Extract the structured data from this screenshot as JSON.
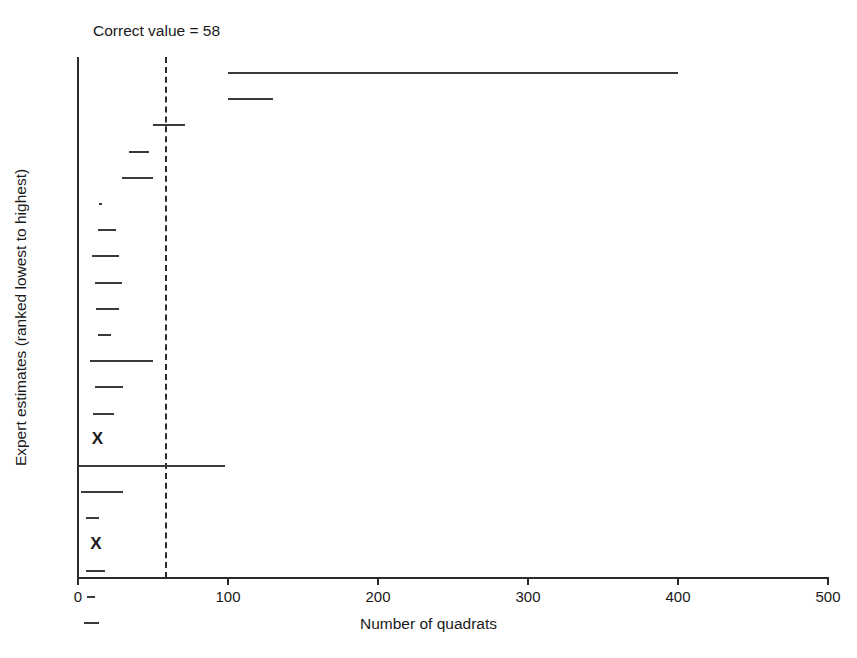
{
  "figure": {
    "x_axis_title": "Number of quadrats",
    "y_axis_title": "Expert estimates (ranked lowest to highest)",
    "reference_label": "Correct value = 58",
    "line_color": "#3a3a3a",
    "axis_color": "#2b2b2b"
  },
  "chart_data": {
    "type": "range-bar",
    "title": "",
    "xlabel": "Number of quadrats",
    "ylabel": "Expert estimates (ranked lowest to highest)",
    "xlim": [
      0,
      500
    ],
    "xticks": [
      0,
      100,
      200,
      300,
      400,
      500
    ],
    "xtick_labels": [
      "0",
      "100",
      "200",
      "300",
      "400",
      "500"
    ],
    "grid": false,
    "legend": null,
    "reference_line": {
      "label": "Correct value = 58",
      "value": 58,
      "style": "dashed"
    },
    "series_name": "Expert estimate intervals",
    "n_experts": 20,
    "note": "Each horizontal segment is one expert's estimated range, ranked from highest at top to lowest at bottom. 'X' marks denote experts who gave a point estimate too small to draw as a range.",
    "intervals": [
      {
        "rank": 20,
        "low": 100,
        "high": 400,
        "marker": "range"
      },
      {
        "rank": 19,
        "low": 100,
        "high": 130,
        "marker": "range"
      },
      {
        "rank": 18,
        "low": 50,
        "high": 71,
        "marker": "range"
      },
      {
        "rank": 17,
        "low": 34,
        "high": 47,
        "marker": "range"
      },
      {
        "rank": 16,
        "low": 29,
        "high": 50,
        "marker": "range"
      },
      {
        "rank": 15,
        "low": 14,
        "high": 16,
        "marker": "range"
      },
      {
        "rank": 14,
        "low": 13,
        "high": 25,
        "marker": "range"
      },
      {
        "rank": 13,
        "low": 9,
        "high": 27,
        "marker": "range"
      },
      {
        "rank": 12,
        "low": 11,
        "high": 29,
        "marker": "range"
      },
      {
        "rank": 11,
        "low": 12,
        "high": 27,
        "marker": "range"
      },
      {
        "rank": 10,
        "low": 13,
        "high": 22,
        "marker": "range"
      },
      {
        "rank": 9,
        "low": 8,
        "high": 50,
        "marker": "range"
      },
      {
        "rank": 8,
        "low": 11,
        "high": 30,
        "marker": "range"
      },
      {
        "rank": 7,
        "low": 10,
        "high": 24,
        "marker": "range"
      },
      {
        "rank": 6,
        "low": 9,
        "high": 9,
        "marker": "x"
      },
      {
        "rank": 5,
        "low": 0,
        "high": 98,
        "marker": "range"
      },
      {
        "rank": 4,
        "low": 2,
        "high": 30,
        "marker": "range"
      },
      {
        "rank": 3,
        "low": 5,
        "high": 14,
        "marker": "range"
      },
      {
        "rank": 2,
        "low": 8,
        "high": 8,
        "marker": "x"
      },
      {
        "rank": 1,
        "low": 5,
        "high": 18,
        "marker": "range"
      },
      {
        "rank": 0,
        "low": 6,
        "high": 11,
        "marker": "range"
      },
      {
        "rank": -1,
        "low": 4,
        "high": 14,
        "marker": "range"
      }
    ]
  },
  "geometry": {
    "plot_left_px": 78,
    "plot_right_px": 828,
    "plot_top_px": 57,
    "plot_bottom_px": 578,
    "row_top_px": 72,
    "row_step_px": 26.2,
    "px_per_unit": 1.5
  }
}
